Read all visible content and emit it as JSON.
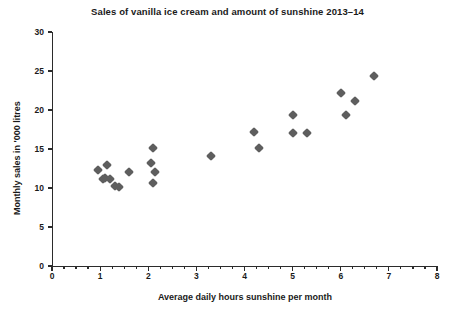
{
  "chart_data": {
    "type": "scatter",
    "title": "Sales of vanilla ice cream and amount of sunshine 2013–14",
    "xlabel": "Average daily hours sunshine per month",
    "ylabel": "Monthly sales in '000 litres",
    "xlim": [
      0,
      8
    ],
    "ylim": [
      0,
      30
    ],
    "xticks": [
      0,
      1,
      2,
      3,
      4,
      5,
      6,
      7,
      8
    ],
    "xtick_labels": [
      "0",
      "1",
      "2",
      "3",
      "4",
      "5",
      "6",
      "7",
      "8"
    ],
    "x_minor_tick_step": 0.25,
    "yticks": [
      0,
      5,
      10,
      15,
      20,
      25,
      30
    ],
    "ytick_labels": [
      "0",
      "5",
      "10",
      "15",
      "20",
      "25",
      "30"
    ],
    "grid": false,
    "legend": false,
    "marker": "diamond",
    "marker_color": "#5e5e5e",
    "points": [
      {
        "x": 0.95,
        "y": 12.3
      },
      {
        "x": 1.15,
        "y": 13.0
      },
      {
        "x": 1.1,
        "y": 11.3
      },
      {
        "x": 1.2,
        "y": 11.2
      },
      {
        "x": 1.05,
        "y": 11.1
      },
      {
        "x": 1.3,
        "y": 10.2
      },
      {
        "x": 1.4,
        "y": 10.1
      },
      {
        "x": 1.6,
        "y": 12.0
      },
      {
        "x": 2.1,
        "y": 15.1
      },
      {
        "x": 2.05,
        "y": 13.2
      },
      {
        "x": 2.15,
        "y": 12.0
      },
      {
        "x": 2.1,
        "y": 10.7
      },
      {
        "x": 3.3,
        "y": 14.1
      },
      {
        "x": 4.2,
        "y": 17.2
      },
      {
        "x": 4.3,
        "y": 15.1
      },
      {
        "x": 5.0,
        "y": 19.3
      },
      {
        "x": 5.0,
        "y": 17.0
      },
      {
        "x": 5.3,
        "y": 17.0
      },
      {
        "x": 6.0,
        "y": 22.2
      },
      {
        "x": 6.3,
        "y": 21.2
      },
      {
        "x": 6.1,
        "y": 19.3
      },
      {
        "x": 6.7,
        "y": 24.4
      }
    ]
  }
}
